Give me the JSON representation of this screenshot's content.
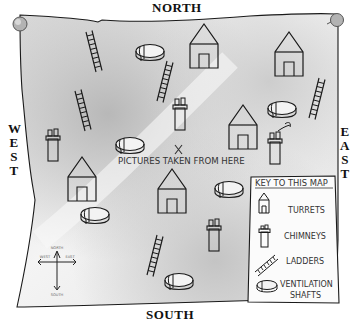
{
  "map": {
    "title": "Map of rooftop",
    "directions": {
      "north": "NORTH",
      "south": "SOUTH",
      "west": [
        "W",
        "E",
        "S",
        "T"
      ],
      "east": [
        "E",
        "A",
        "S",
        "T"
      ]
    },
    "center_marker": {
      "symbol": "X",
      "label": "PICTURES TAKEN FROM HERE"
    },
    "compass_rose": {
      "north": "NORTH",
      "south": "SOUTH",
      "west": "WEST",
      "east": "EAST"
    },
    "key": {
      "title": "KEY TO THIS MAP",
      "items": [
        {
          "icon": "turret-icon",
          "label": "TURRETS"
        },
        {
          "icon": "chimney-icon",
          "label": "CHIMNEYS"
        },
        {
          "icon": "ladder-icon",
          "label": "LADDERS"
        },
        {
          "icon": "ventilation-shaft-icon",
          "label_line1": "VENTILATION",
          "label_line2": "SHAFTS"
        }
      ]
    },
    "colors": {
      "ink": "#1a1a1a",
      "paper": "#e9e9e9",
      "paper_shade": "#bdbdbd",
      "pin": "#b0b0b0"
    }
  }
}
